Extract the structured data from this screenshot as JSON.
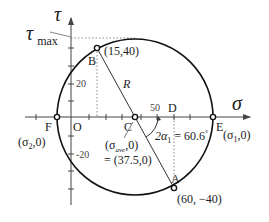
{
  "diagram": {
    "axes": {
      "horizontal_label": "σ",
      "vertical_label": "τ",
      "origin_label": "O",
      "tick_labels": {
        "tau_pos": "20",
        "tau_neg": "-20",
        "sigma": "50"
      }
    },
    "points": {
      "A": {
        "label": "A",
        "coords": "(60, −40)"
      },
      "B": {
        "label": "B",
        "coords": "(15,40)"
      },
      "C": {
        "label": "C",
        "coords_line1": "(σ",
        "coords_sub": "ave",
        "coords_line1_end": ",0)",
        "coords_line2": "= (37.5,0)"
      },
      "D": {
        "label": "D"
      },
      "E": {
        "label": "E",
        "coords_pre": "(σ",
        "coords_sub": "1",
        "coords_post": ",0)"
      },
      "F": {
        "label": "F",
        "coords_pre": "(σ",
        "coords_sub": "2",
        "coords_post": ",0)"
      }
    },
    "radius_label": "R",
    "tau_max_label": "τ",
    "tau_max_sub": "max",
    "angle": {
      "prefix": "2α",
      "sub": "1",
      "value": " = 60.6",
      "unit": "°"
    },
    "colors": {
      "circle": "#111111",
      "axis": "#444444",
      "dotted": "#888888"
    }
  }
}
